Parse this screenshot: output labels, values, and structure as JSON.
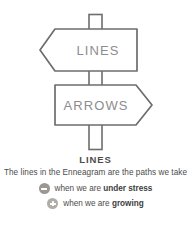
{
  "illustration": {
    "name": "signpost-illustration",
    "stroke_color": "#6d6d6d",
    "sign_text_color": "#8d8d8d",
    "post": {
      "name": "signpost-pole"
    },
    "signs": [
      {
        "id": "lines-sign",
        "label": "LINES",
        "direction": "left",
        "icon": "left-arrow-sign-icon"
      },
      {
        "id": "arrows-sign",
        "label": "ARROWS",
        "direction": "right",
        "icon": "right-arrow-sign-icon"
      }
    ]
  },
  "caption": {
    "title": "LINES",
    "description": "The lines in the Enneagram are the paths we take",
    "bullets": [
      {
        "icon": "minus-circle-icon",
        "icon_color": "#9b9791",
        "sign": "minus",
        "text_prefix": "when we are ",
        "text_emphasis": "under stress"
      },
      {
        "icon": "plus-circle-icon",
        "icon_color": "#b0aca6",
        "sign": "plus",
        "text_prefix": "when we are ",
        "text_emphasis": "growing"
      }
    ]
  }
}
